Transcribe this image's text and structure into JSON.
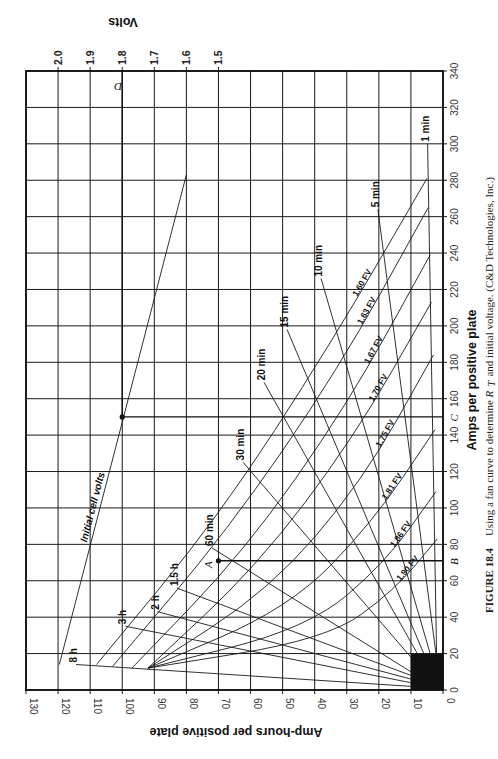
{
  "chart_data": {
    "type": "line",
    "title": "Fan curve",
    "orientation": "rotated 90° clockwise (amps on vertical page axis, amp-hours on horizontal page axis)",
    "xlabel": "Amps per positive plate",
    "ylabel": "Amp-hours per positive plate",
    "secondary_axis_label": "Volts",
    "amps_axis": {
      "range": [
        0,
        340
      ],
      "ticks": [
        0,
        20,
        40,
        60,
        80,
        100,
        120,
        140,
        160,
        180,
        200,
        220,
        240,
        260,
        280,
        300,
        320,
        340
      ]
    },
    "amphours_axis": {
      "range": [
        0,
        130
      ],
      "ticks": [
        0,
        10,
        20,
        30,
        40,
        50,
        60,
        70,
        80,
        90,
        100,
        110,
        120,
        130
      ]
    },
    "volts_axis": {
      "ticks": [
        "2.0",
        "1.9",
        "1.8",
        "1.7",
        "1.6",
        "1.5"
      ],
      "values": [
        2.0,
        1.9,
        1.8,
        1.7,
        1.6,
        1.5
      ]
    },
    "grid": true,
    "time_lines": [
      {
        "name": "1 min",
        "points": [
          [
            4.8,
            300
          ],
          [
            2,
            20
          ]
        ]
      },
      {
        "name": "5 min",
        "points": [
          [
            20.3,
            264
          ],
          [
            2.2,
            20
          ]
        ]
      },
      {
        "name": "10 min",
        "points": [
          [
            38,
            226
          ],
          [
            4,
            20
          ]
        ]
      },
      {
        "name": "15 min",
        "points": [
          [
            48.6,
            198
          ],
          [
            6,
            20
          ]
        ]
      },
      {
        "name": "20 min",
        "points": [
          [
            55.8,
            169
          ],
          [
            8,
            20
          ]
        ]
      },
      {
        "name": "30 min",
        "points": [
          [
            62.3,
            125
          ],
          [
            10,
            18
          ]
        ]
      },
      {
        "name": "60 min",
        "points": [
          [
            72,
            78
          ],
          [
            10,
            10
          ]
        ]
      },
      {
        "name": "1.5 h",
        "points": [
          [
            83,
            56
          ],
          [
            10,
            8
          ]
        ]
      },
      {
        "name": "2 h",
        "points": [
          [
            89,
            43
          ],
          [
            10,
            6
          ]
        ]
      },
      {
        "name": "3 h",
        "points": [
          [
            99,
            35
          ],
          [
            10,
            4
          ]
        ]
      },
      {
        "name": "8 h",
        "points": [
          [
            114.4,
            14
          ],
          [
            10,
            2
          ]
        ]
      }
    ],
    "final_voltage_curves": [
      {
        "name": "1.60 FV",
        "points": [
          [
            108,
            14
          ],
          [
            70,
            95
          ],
          [
            35,
            190
          ],
          [
            5,
            281
          ]
        ]
      },
      {
        "name": "1.63 FV",
        "points": [
          [
            103,
            13
          ],
          [
            67,
            88
          ],
          [
            33,
            175
          ],
          [
            4.6,
            265
          ]
        ]
      },
      {
        "name": "1.67 FV",
        "points": [
          [
            97,
            12
          ],
          [
            62,
            76
          ],
          [
            30,
            156
          ],
          [
            4,
            239
          ]
        ]
      },
      {
        "name": "1.70 FV",
        "points": [
          [
            92,
            12
          ],
          [
            58,
            68
          ],
          [
            28,
            138
          ],
          [
            3.6,
            213
          ]
        ]
      },
      {
        "name": "1.75 FV",
        "points": [
          [
            92,
            12
          ],
          [
            54,
            55
          ],
          [
            25,
            115
          ],
          [
            3,
            184
          ]
        ]
      },
      {
        "name": "1.81 FV",
        "points": [
          [
            92,
            12
          ],
          [
            48,
            45
          ],
          [
            22,
            92
          ],
          [
            2.5,
            143
          ]
        ]
      },
      {
        "name": "1.86 FV",
        "points": [
          [
            92,
            12
          ],
          [
            42,
            34
          ],
          [
            18,
            70
          ],
          [
            2.2,
            109
          ]
        ]
      },
      {
        "name": "1.90 FV",
        "points": [
          [
            92,
            12
          ],
          [
            36,
            28
          ],
          [
            15,
            55
          ],
          [
            1.8,
            83
          ]
        ]
      }
    ],
    "initial_cell_volts_line": {
      "name": "Initial cell volts",
      "points": [
        [
          119.6,
          14
        ],
        [
          80,
          283
        ]
      ]
    },
    "annotations": [
      {
        "letter": "A",
        "amp_hours": 70,
        "amps": 71,
        "label": "A"
      },
      {
        "letter": "B",
        "amps": 71,
        "label": "B"
      },
      {
        "letter": "C",
        "amps": 150,
        "label": "C"
      },
      {
        "letter": "D",
        "volts": 1.8,
        "label": "D"
      },
      {
        "point": "initial-volts intersection",
        "amp_hours": 100,
        "amps": 150
      }
    ],
    "shaded_region": {
      "amp_hours": [
        0,
        10
      ],
      "amps": [
        0,
        20
      ],
      "color": "#111111"
    },
    "legend_position": "inline labels"
  },
  "axes": {
    "amps_title": "Amps per positive plate",
    "amphours_title": "Amp-hours per positive plate",
    "volts_title": "Volts"
  },
  "labels": {
    "initial_cell_volts": "Initial cell volts",
    "A": "A",
    "B": "B",
    "C": "C",
    "D": "D"
  },
  "caption": {
    "figure": "FIGURE 18.4",
    "text_before": "Using a fan curve to determine ",
    "symbol": "R",
    "subscript": "T",
    "text_after": " and initial voltage. (C&D Technologies, Inc.)"
  },
  "colors": {
    "ink": "#1a1a1a",
    "background": "#ffffff",
    "shaded": "#111111"
  }
}
